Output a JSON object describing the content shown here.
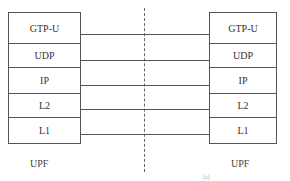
{
  "diagram": {
    "type": "protocol-stack",
    "left_node": {
      "label": "UPF",
      "layers": [
        "GTP-U",
        "UDP",
        "IP",
        "L2",
        "L1"
      ]
    },
    "right_node": {
      "label": "UPF",
      "layers": [
        "GTP-U",
        "UDP",
        "IP",
        "L2",
        "L1"
      ]
    },
    "interface": "dashed-divider",
    "footer_note": "(a)"
  }
}
